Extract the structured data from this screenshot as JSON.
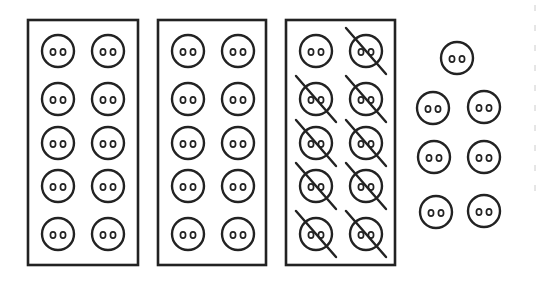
{
  "figure": {
    "colors": {
      "stroke": "#222222",
      "background": "#ffffff"
    },
    "boxes": [
      {
        "label": "box-1",
        "count": 10,
        "crossed": 0,
        "x": 28,
        "y": 20,
        "w": 110,
        "h": 245
      },
      {
        "label": "box-2",
        "count": 10,
        "crossed": 0,
        "x": 158,
        "y": 20,
        "w": 108,
        "h": 245
      },
      {
        "label": "box-3",
        "count": 10,
        "crossed": 9,
        "x": 286,
        "y": 20,
        "w": 109,
        "h": 245
      }
    ],
    "loose_buttons": {
      "count": 7
    },
    "totals": {
      "buttons": 37,
      "crossed_out": 9,
      "remaining": 28
    }
  }
}
